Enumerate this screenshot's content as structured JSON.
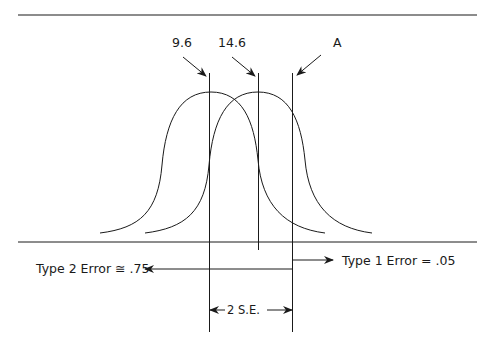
{
  "diagram": {
    "labels": {
      "mean_null": "9.6",
      "mean_alt": "14.6",
      "critical": "A",
      "type2": "Type 2 Error ≅ .75",
      "type1": "Type 1 Error = .05",
      "se": "2 S.E."
    },
    "colors": {
      "ink": "#1a1a1a",
      "background": "#ffffff"
    }
  }
}
